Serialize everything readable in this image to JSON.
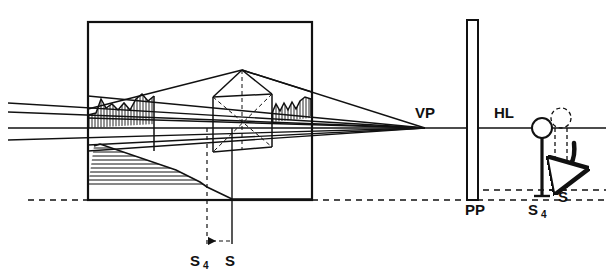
{
  "figure": {
    "type": "line-diagram",
    "background_color": "#ffffff",
    "ink_color": "#111111"
  },
  "labels": {
    "vanishing_point": "VP",
    "horizon_line": "HL",
    "picture_plane": "PP",
    "station_point_shifted": "S4",
    "station_point": "S",
    "plan_station_point_shifted": "S4",
    "plan_station_point": "S"
  },
  "label_positions": {
    "vanishing_point": {
      "x": 415,
      "y": 118
    },
    "horizon_line": {
      "x": 494,
      "y": 118
    },
    "picture_plane": {
      "x": 465,
      "y": 215
    },
    "station_point_shifted_elev": {
      "x": 528,
      "y": 215
    },
    "station_point_elev": {
      "x": 561,
      "y": 202
    },
    "station_point_shifted_plan": {
      "x": 196,
      "y": 262
    },
    "station_point_plan": {
      "x": 228,
      "y": 262
    }
  },
  "geometry": {
    "plan_frame": {
      "x": 88,
      "y": 22,
      "width": 224,
      "height": 178
    },
    "horizon_line_y": 128,
    "ground_dash_y": 200,
    "upper_dash_y": 190,
    "vanishing_point": {
      "x": 425,
      "y": 128
    },
    "picture_plane_bar": {
      "x": 467,
      "y": 20,
      "width": 11,
      "height": 180
    },
    "observer": {
      "head_center": {
        "x": 542,
        "y": 128
      },
      "head_radius": 10,
      "body_top": {
        "x": 542,
        "y": 138
      },
      "body_bottom": {
        "x": 542,
        "y": 196
      },
      "foot_half_width": 8,
      "ghost_head_center": {
        "x": 561,
        "y": 118
      },
      "ghost_head_radius": 10,
      "ghost_body_x": 561,
      "ghost_body_bottom_y": 190
    },
    "plan_markers": {
      "s4_vertical_x": 207,
      "s_vertical_x": 232,
      "marker_bottom_y": 248
    },
    "sight_lines_left_edge_y": [
      103,
      112,
      128,
      140
    ]
  },
  "elements": [
    {
      "name": "plan-frame",
      "description": "large outer rectangle enclosing the plan view"
    },
    {
      "name": "sight-lines",
      "description": "four convergent straight lines running from the left margin to the vanishing point"
    },
    {
      "name": "horizon-line",
      "description": "long horizontal line through VP extending to the right margin"
    },
    {
      "name": "left-hatched-roof",
      "description": "irregular crenellated roof profile with dense vertical hatching, left building"
    },
    {
      "name": "right-hatched-roof",
      "description": "irregular crenellated roof profile with dense vertical hatching, right building"
    },
    {
      "name": "center-gable",
      "description": "central pitched roof block with dashed diagonal construction lines and a dashed vertical axis"
    },
    {
      "name": "lower-hatched-wedge",
      "description": "large horizontally-hatched triangular wedge at the lower-left of the plan frame"
    },
    {
      "name": "ground-line-dashed",
      "description": "dash-dot ground line running the full width of the figure"
    },
    {
      "name": "picture-plane-bar",
      "description": "tall narrow vertical rectangle labelled PP"
    },
    {
      "name": "observer-figure",
      "description": "stick figure of the observer with a circular head, labelled S4, and a dashed ghost position labelled S"
    },
    {
      "name": "shift-arrow",
      "description": "curved arrow showing the observer shifting from S to S4"
    },
    {
      "name": "plan-shift-arrow",
      "description": "short horizontal arrow between the S4 and S dashed verticals in the plan"
    }
  ]
}
